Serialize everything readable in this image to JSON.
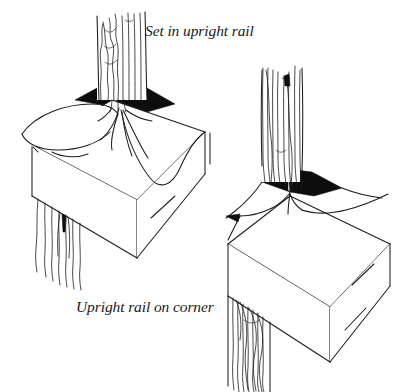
{
  "figure": {
    "background_color": "#ffffff",
    "ink_color": "#1c1c1c",
    "shadow_color": "#0d0d0d",
    "captions": {
      "top": "Set in upright rail",
      "bottom": "Upright rail on corner"
    },
    "panels": [
      {
        "id": "left",
        "name": "set-in-upright-rail-illustration",
        "caption_ref": "top",
        "description": "Boxed rail corner viewed in three-quarter perspective with a vertical wood-grain upright rail set inboard from the corner, dark wedge shading at the base of the upright, draped fabric folds spreading over the rail top, and loose grain strands hanging below the rail.",
        "elements": [
          "upright-rail-post",
          "post-wood-grain",
          "dark-shadow-wedge",
          "fabric-drape-folds",
          "rail-box",
          "hanging-grain-strands"
        ]
      },
      {
        "id": "right",
        "name": "upright-rail-on-corner-illustration",
        "caption_ref": "bottom",
        "description": "Boxed rail corner viewed in three-quarter perspective with the vertical wood-grain upright rail standing directly on the corner point, dark wedge shading splayed either side of the post, fabric sweeping down both rail faces, and a grained leg descending at the left front face.",
        "elements": [
          "upright-rail-post",
          "post-wood-grain",
          "dark-shadow-wedge",
          "fabric-drape-folds",
          "rail-box",
          "corner-leg-grain"
        ]
      }
    ]
  }
}
